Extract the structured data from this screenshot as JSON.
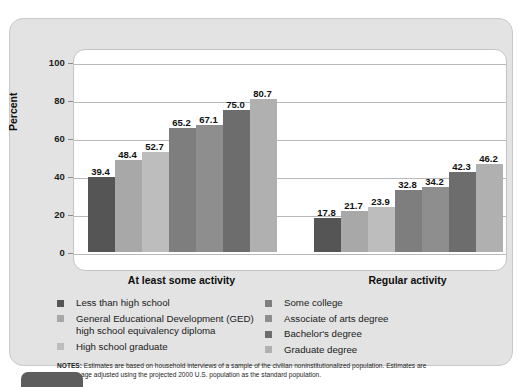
{
  "chart_data": {
    "type": "bar",
    "title": "",
    "xlabel": "",
    "ylabel": "Percent",
    "ylim": [
      0,
      100
    ],
    "yticks": [
      0,
      20,
      40,
      60,
      80,
      100
    ],
    "grid": true,
    "legend_position": "bottom",
    "categories": [
      "At least some activity",
      "Regular activity"
    ],
    "series": [
      {
        "name": "Less than high school",
        "color": "#555555",
        "values": [
          39.4,
          17.8
        ]
      },
      {
        "name": "General Educational Development (GED) high school equivalency diploma",
        "color": "#a8a8a8",
        "values": [
          48.4,
          21.7
        ]
      },
      {
        "name": "High school graduate",
        "color": "#bdbdbd",
        "values": [
          52.7,
          23.9
        ]
      },
      {
        "name": "Some college",
        "color": "#7e7e7e",
        "values": [
          65.2,
          32.8
        ]
      },
      {
        "name": "Associate of arts degree",
        "color": "#8e8e8e",
        "values": [
          67.1,
          34.2
        ]
      },
      {
        "name": "Bachelor's degree",
        "color": "#6d6d6d",
        "values": [
          75.0,
          42.3
        ]
      },
      {
        "name": "Graduate degree",
        "color": "#b0b0b0",
        "values": [
          80.7,
          46.2
        ]
      }
    ]
  },
  "legend": {
    "column1": [
      {
        "label": "Less than high school",
        "color": "#555555"
      },
      {
        "label": "General Educational Development (GED) high school equivalency diploma",
        "color": "#a8a8a8"
      },
      {
        "label": "High school graduate",
        "color": "#bdbdbd"
      }
    ],
    "column2": [
      {
        "label": "Some college",
        "color": "#7e7e7e"
      },
      {
        "label": "Associate of arts degree",
        "color": "#8e8e8e"
      },
      {
        "label": "Bachelor's degree",
        "color": "#6d6d6d"
      },
      {
        "label": "Graduate degree",
        "color": "#b0b0b0"
      }
    ]
  },
  "notes": {
    "heading": "NOTES:",
    "line1": "Estimates are based on household interviews of a sample of the civilian noninstitutionalized population. Estimates are",
    "line2": "age adjusted using the projected 2000 U.S. population as the standard population."
  }
}
